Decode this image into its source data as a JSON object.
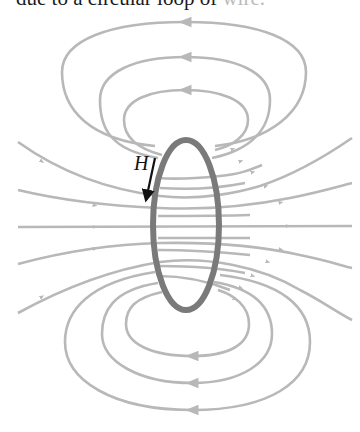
{
  "caption": {
    "text": "due to a circular loop of ",
    "faded_text": "wire."
  },
  "figure": {
    "field_label": "H",
    "colors": {
      "field_line": "#b8b8b8",
      "loop": "#7a7a7a",
      "h_arrow": "#111111",
      "text": "#1a1a1a"
    },
    "loop": {
      "cx": 186,
      "cy": 225,
      "rx": 33,
      "ry": 85
    },
    "field_line_count": 16,
    "closed_loop_count": 6
  }
}
